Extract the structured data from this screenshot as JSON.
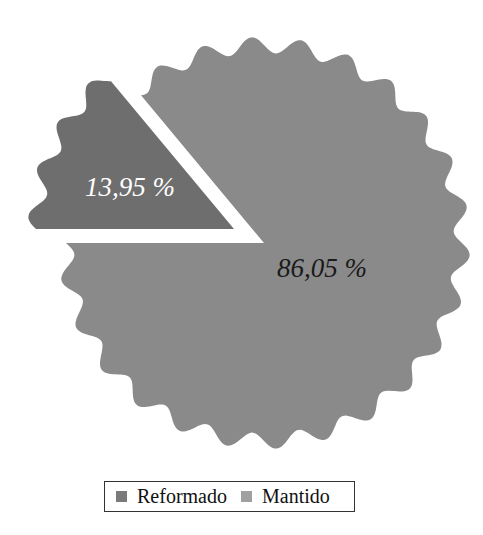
{
  "chart_data": {
    "type": "pie",
    "title": "",
    "style": "exploded pie with wavy outer edge",
    "categories": [
      "Reformado",
      "Mantido"
    ],
    "values": [
      13.95,
      86.05
    ],
    "value_labels": [
      "13,95 %",
      "86,05 %"
    ],
    "unit": "%",
    "colors": [
      "#6e6e6e",
      "#8a8a8a"
    ],
    "exploded": [
      "Reformado"
    ],
    "legend": {
      "position": "bottom",
      "entries": [
        {
          "label": "Reformado",
          "color": "#7a7a7a"
        },
        {
          "label": "Mantido",
          "color": "#a0a0a0"
        }
      ]
    }
  },
  "geometry": {
    "center": [
      264,
      243
    ],
    "radius": 198,
    "wave_amplitude": 8,
    "wave_count": 26,
    "small_offset": [
      -30,
      -14
    ],
    "small_start_deg": 180,
    "gap_color": "#ffffff"
  },
  "labels": {
    "small": {
      "text": "13,95 %",
      "x": 130,
      "y": 187
    },
    "large": {
      "text": "86,05 %",
      "x": 322,
      "y": 268
    }
  },
  "legend": {
    "items": [
      {
        "label": "Reformado",
        "color": "#7a7a7a"
      },
      {
        "label": "Mantido",
        "color": "#a0a0a0"
      }
    ]
  }
}
